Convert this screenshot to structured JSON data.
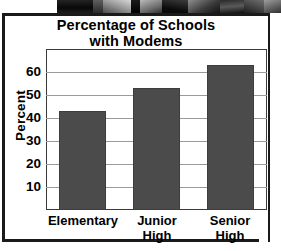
{
  "figure": {
    "title_line1": "Percentage of Schools",
    "title_line2": "with Modems",
    "photo_caption": "photograph-strip"
  },
  "chart_data": {
    "type": "bar",
    "title": "Percentage of Schools with Modems",
    "xlabel": "",
    "ylabel": "Percent",
    "categories": [
      "Elementary",
      "Junior High",
      "Senior High"
    ],
    "category_lines": [
      [
        "Elementary"
      ],
      [
        "Junior",
        "High"
      ],
      [
        "Senior",
        "High"
      ]
    ],
    "values": [
      43,
      53,
      63
    ],
    "ylim": [
      0,
      70
    ],
    "yticks": [
      10,
      20,
      30,
      40,
      50,
      60
    ],
    "ytick_labels": [
      "10",
      "20",
      "30",
      "40",
      "50",
      "60"
    ],
    "grid": true,
    "legend": "none",
    "bar_color": "#4b4b4b",
    "gridline_color": "#9a9a9a",
    "axis_color": "#3a3a3a",
    "background": "#ffffff"
  }
}
